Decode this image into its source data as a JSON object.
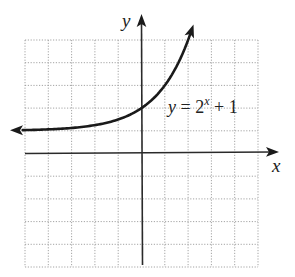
{
  "chart_data": {
    "type": "line",
    "title": "",
    "xlabel": "x",
    "ylabel": "y",
    "xlim": [
      -5,
      5
    ],
    "ylim": [
      -5,
      5
    ],
    "grid": true,
    "grid_style": "dotted",
    "grid_step": 1,
    "legend": null,
    "series": [
      {
        "name": "y = 2^x + 1",
        "function": "2^x + 1",
        "horizontal_asymptote": 1,
        "y_intercept": 2,
        "arrows": "both-ends",
        "x": [
          -5,
          -4,
          -3,
          -2,
          -1,
          0,
          1,
          2,
          2.2
        ],
        "y": [
          1.03,
          1.06,
          1.13,
          1.25,
          1.5,
          2,
          3,
          5,
          5.6
        ]
      }
    ],
    "annotations": [
      {
        "text": "y = 2^x + 1",
        "position": "right of curve near (1.2, 2)"
      }
    ]
  },
  "labels": {
    "x_axis": "x",
    "y_axis": "y",
    "equation": {
      "var_y": "y",
      "equals": " = 2",
      "exponent": "x",
      "tail": " + 1"
    }
  }
}
